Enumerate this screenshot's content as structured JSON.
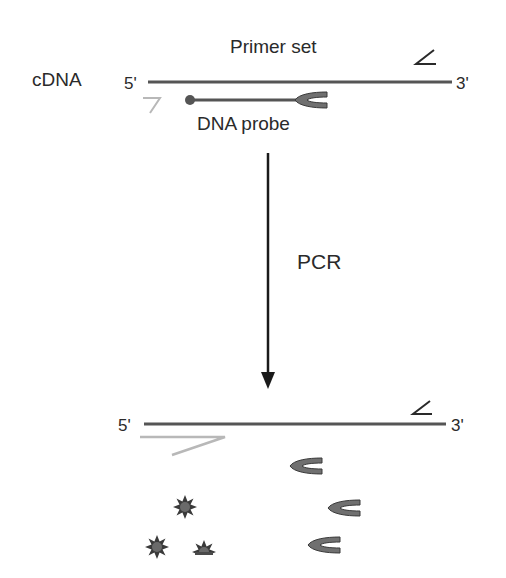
{
  "diagram": {
    "title": "Primer set",
    "top_strand": {
      "label": "cDNA",
      "five_prime": "5'",
      "three_prime": "3'",
      "probe_label": "DNA probe"
    },
    "process": {
      "label": "PCR"
    },
    "bottom_strand": {
      "five_prime": "5'",
      "three_prime": "3'"
    },
    "colors": {
      "strand": "#555555",
      "primer_forward": "#b8b8b8",
      "primer_reverse": "#2a2a2a",
      "probe_fill": "#707070",
      "probe_outline": "#3a3a3a",
      "reporter_fill": "#4a4a4a",
      "arrow": "#1a1a1a"
    }
  }
}
